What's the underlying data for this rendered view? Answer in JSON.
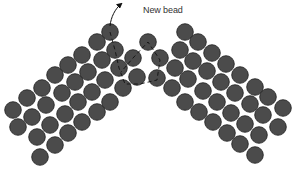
{
  "annotation": {
    "label": "New bead"
  },
  "colors": {
    "bead_fill": "#4b4b4b",
    "bead_stroke": "#1e1e1e",
    "thread": "#111111",
    "background": "#ffffff"
  },
  "bead_radius": 8.3,
  "beads": {
    "left_arm": [
      [
        13,
        110
      ],
      [
        27,
        98
      ],
      [
        42,
        88
      ],
      [
        55,
        75
      ],
      [
        68,
        65
      ],
      [
        82,
        55
      ],
      [
        97,
        42
      ],
      [
        110,
        32
      ],
      [
        18,
        127
      ],
      [
        32,
        117
      ],
      [
        46,
        105
      ],
      [
        62,
        93
      ],
      [
        75,
        82
      ],
      [
        88,
        72
      ],
      [
        102,
        60
      ],
      [
        115,
        50
      ],
      [
        37,
        137
      ],
      [
        50,
        125
      ],
      [
        65,
        114
      ],
      [
        78,
        102
      ],
      [
        92,
        92
      ],
      [
        105,
        80
      ],
      [
        119,
        68
      ],
      [
        40,
        157
      ],
      [
        55,
        145
      ],
      [
        68,
        133
      ],
      [
        82,
        122
      ],
      [
        97,
        112
      ],
      [
        110,
        102
      ],
      [
        123,
        88
      ],
      [
        137,
        77
      ]
    ],
    "center": [
      [
        133,
        58
      ],
      [
        148,
        42
      ],
      [
        160,
        58
      ],
      [
        157,
        78
      ]
    ],
    "right_arm": [
      [
        185,
        32
      ],
      [
        198,
        42
      ],
      [
        212,
        53
      ],
      [
        226,
        64
      ],
      [
        240,
        75
      ],
      [
        255,
        87
      ],
      [
        268,
        97
      ],
      [
        283,
        108
      ],
      [
        180,
        50
      ],
      [
        193,
        61
      ],
      [
        207,
        71
      ],
      [
        221,
        82
      ],
      [
        235,
        93
      ],
      [
        250,
        104
      ],
      [
        263,
        115
      ],
      [
        278,
        127
      ],
      [
        175,
        68
      ],
      [
        188,
        79
      ],
      [
        203,
        91
      ],
      [
        217,
        102
      ],
      [
        231,
        113
      ],
      [
        245,
        124
      ],
      [
        259,
        135
      ],
      [
        172,
        88
      ],
      [
        185,
        102
      ],
      [
        199,
        112
      ],
      [
        213,
        122
      ],
      [
        227,
        133
      ],
      [
        240,
        144
      ],
      [
        255,
        155
      ]
    ]
  },
  "thread_path": "M110,32 L115,50 L119,68 L125,84 L140,84 L157,80 L160,60 L148,42 L133,58 L121,72",
  "arrow_path": "M110,26 C111,17 115,9 121,4"
}
